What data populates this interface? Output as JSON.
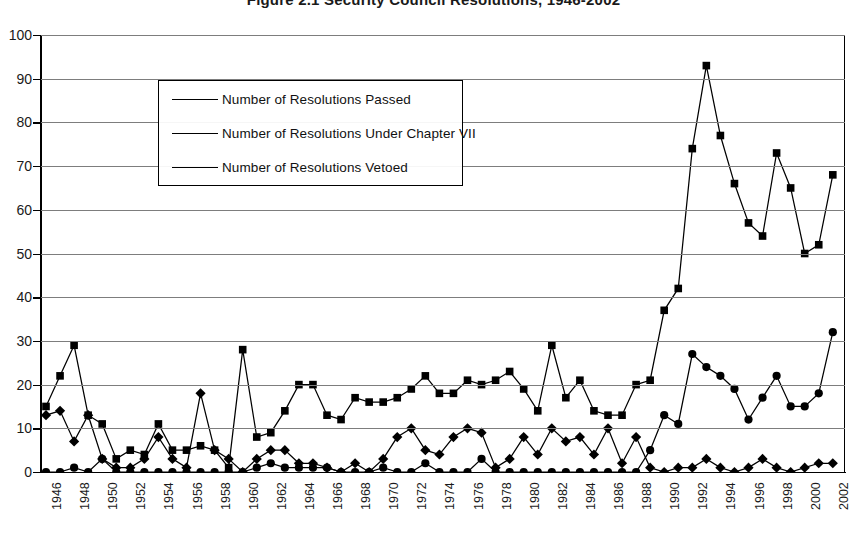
{
  "title": "Figure 2.1    Security Council Resolutions, 1946-2002",
  "legend": {
    "items": [
      {
        "label": "Number of Resolutions Passed",
        "marker": "square-marker"
      },
      {
        "label": "Number of Resolutions Under Chapter VII",
        "marker": "circle-marker"
      },
      {
        "label": "Number of Resolutions Vetoed",
        "marker": "diamond-marker"
      }
    ]
  },
  "axes": {
    "y_ticks": [
      "0",
      "10",
      "20",
      "30",
      "40",
      "50",
      "60",
      "70",
      "80",
      "90",
      "100"
    ],
    "x_ticks": [
      "1946",
      "1948",
      "1950",
      "1952",
      "1954",
      "1956",
      "1958",
      "1960",
      "1962",
      "1964",
      "1966",
      "1968",
      "1970",
      "1972",
      "1974",
      "1976",
      "1978",
      "1980",
      "1982",
      "1984",
      "1986",
      "1988",
      "1990",
      "1992",
      "1994",
      "1996",
      "1998",
      "2000",
      "2002"
    ]
  },
  "colors": {
    "line": "#000000",
    "grid": "#7d7d7d",
    "axis": "#000000",
    "background": "#ffffff"
  },
  "chart_data": {
    "type": "line",
    "title": "Figure 2.1    Security Council Resolutions, 1946-2002",
    "xlabel": "",
    "ylabel": "",
    "ylim": [
      0,
      100
    ],
    "xlim": [
      1946,
      2002
    ],
    "grid": true,
    "legend_position": "upper-left-inside",
    "x": [
      1946,
      1947,
      1948,
      1949,
      1950,
      1951,
      1952,
      1953,
      1954,
      1955,
      1956,
      1957,
      1958,
      1959,
      1960,
      1961,
      1962,
      1963,
      1964,
      1965,
      1966,
      1967,
      1968,
      1969,
      1970,
      1971,
      1972,
      1973,
      1974,
      1975,
      1976,
      1977,
      1978,
      1979,
      1980,
      1981,
      1982,
      1983,
      1984,
      1985,
      1986,
      1987,
      1988,
      1989,
      1990,
      1991,
      1992,
      1993,
      1994,
      1995,
      1996,
      1997,
      1998,
      1999,
      2000,
      2001,
      2002
    ],
    "series": [
      {
        "name": "Number of Resolutions Passed",
        "marker": "square",
        "values": [
          15,
          22,
          29,
          13,
          11,
          3,
          5,
          4,
          11,
          5,
          5,
          6,
          5,
          1,
          28,
          8,
          9,
          14,
          20,
          20,
          13,
          12,
          17,
          16,
          16,
          17,
          19,
          22,
          18,
          18,
          21,
          20,
          21,
          23,
          19,
          14,
          29,
          17,
          21,
          14,
          13,
          13,
          20,
          21,
          37,
          42,
          74,
          93,
          77,
          66,
          57,
          54,
          73,
          65,
          50,
          52,
          68
        ]
      },
      {
        "name": "Number of Resolutions Under Chapter VII",
        "marker": "circle",
        "values": [
          0,
          0,
          1,
          0,
          3,
          0,
          0,
          0,
          0,
          0,
          0,
          0,
          0,
          0,
          0,
          1,
          2,
          1,
          1,
          1,
          1,
          0,
          0,
          0,
          1,
          0,
          0,
          2,
          0,
          0,
          0,
          3,
          0,
          0,
          0,
          0,
          0,
          0,
          0,
          0,
          0,
          0,
          0,
          5,
          13,
          11,
          27,
          24,
          22,
          19,
          12,
          17,
          22,
          15,
          15,
          18,
          32
        ]
      },
      {
        "name": "Number of Resolutions Vetoed",
        "marker": "diamond",
        "values": [
          13,
          14,
          7,
          13,
          3,
          1,
          1,
          3,
          8,
          3,
          1,
          18,
          5,
          3,
          0,
          3,
          5,
          5,
          2,
          2,
          1,
          0,
          2,
          0,
          3,
          8,
          10,
          5,
          4,
          8,
          10,
          9,
          1,
          3,
          8,
          4,
          10,
          7,
          8,
          4,
          10,
          2,
          8,
          1,
          0,
          1,
          1,
          3,
          1,
          0,
          1,
          3,
          1,
          0,
          1,
          2,
          2
        ]
      }
    ]
  }
}
